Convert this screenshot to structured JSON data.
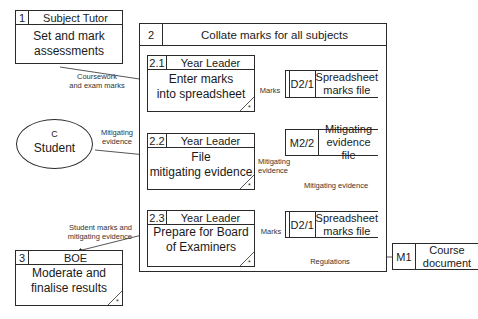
{
  "diagram": {
    "type": "data-flow-diagram",
    "external_entities": [
      {
        "id": "C",
        "name": "Student"
      }
    ],
    "processes": [
      {
        "id": "1",
        "owner": "Subject Tutor",
        "description": "Set and mark assessments",
        "line1": "Set and mark",
        "line2": "assessments"
      },
      {
        "id": "2",
        "owner": "",
        "description": "Collate marks for all subjects"
      },
      {
        "id": "2.1",
        "owner": "Year Leader",
        "line1": "Enter marks",
        "line2": "into spreadsheet",
        "has_star": true
      },
      {
        "id": "2.2",
        "owner": "Year Leader",
        "line1": "File",
        "line2": "mitigating evidence",
        "has_star": true
      },
      {
        "id": "2.3",
        "owner": "Year Leader",
        "line1": "Prepare for Board",
        "line2": "of Examiners",
        "has_star": true
      },
      {
        "id": "3",
        "owner": "BOE",
        "line1": "Moderate and",
        "line2": "finalise results",
        "has_star": true
      }
    ],
    "data_stores": [
      {
        "id": "D2/1",
        "line1": "Spreadsheet",
        "line2": "marks file",
        "placement": "top"
      },
      {
        "id": "M2/2",
        "line1": "Mitigating",
        "line2": "evidence file"
      },
      {
        "id": "D2/1",
        "line1": "Spreadsheet",
        "line2": "marks file",
        "placement": "bottom"
      },
      {
        "id": "M1",
        "line1": "Course",
        "line2": "document"
      }
    ],
    "flows": [
      {
        "from": "1",
        "to": "2.1",
        "line1": "Coursework",
        "line2": "and exam marks"
      },
      {
        "from": "2.1",
        "to": "D2/1",
        "label": "Marks"
      },
      {
        "from": "C",
        "to": "2.2",
        "line1": "Mitigating",
        "line2": "evidence"
      },
      {
        "from": "2.2",
        "to": "M2/2",
        "line1": "Mitigating",
        "line2": "evidence"
      },
      {
        "from": "M2/2",
        "to": "2.3",
        "label": "Mitigating evidence"
      },
      {
        "from": "D2/1",
        "to": "2.3",
        "label": "Marks"
      },
      {
        "from": "M1",
        "to": "2.3",
        "label": "Regulations"
      },
      {
        "from": "2.3",
        "to": "3",
        "line1": "Student marks and",
        "line2": "mitigating evidence"
      }
    ],
    "star_symbol": "*"
  }
}
